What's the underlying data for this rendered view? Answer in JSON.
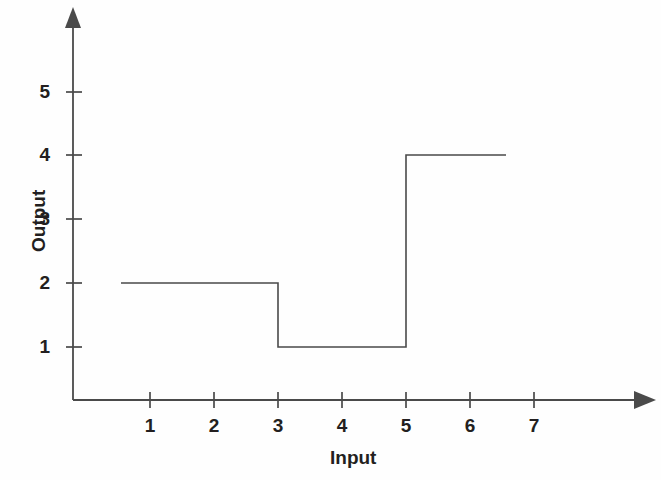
{
  "chart_data": {
    "type": "line",
    "subtype": "step",
    "title": "",
    "subtitle": "",
    "xlabel": "Input",
    "ylabel": "Output",
    "xticks": [
      1,
      2,
      3,
      4,
      5,
      6,
      7
    ],
    "xtick_labels": [
      "1",
      "2",
      "3",
      "4",
      "5",
      "6",
      "7"
    ],
    "yticks": [
      1,
      2,
      3,
      4,
      5
    ],
    "ytick_labels": [
      "1",
      "2",
      "3",
      "4",
      "5"
    ],
    "xlim": [
      0,
      8.1
    ],
    "ylim": [
      0,
      5.85
    ],
    "grid": false,
    "legend": null,
    "axis_style": "arrow-ended L-axes",
    "line_color": "#4a4a4a",
    "line_width": 1.6,
    "series": [
      {
        "name": "step",
        "step_segments": [
          {
            "x_start": 0.56,
            "x_end": 3.0,
            "y": 2
          },
          {
            "x_start": 3.0,
            "x_end": 5.0,
            "y": 1
          },
          {
            "x_start": 5.0,
            "x_end": 6.55,
            "y": 4
          }
        ],
        "points": [
          {
            "x": 0.56,
            "y": 2
          },
          {
            "x": 3.0,
            "y": 2
          },
          {
            "x": 3.0,
            "y": 1
          },
          {
            "x": 5.0,
            "y": 1
          },
          {
            "x": 5.0,
            "y": 4
          },
          {
            "x": 6.55,
            "y": 4
          }
        ]
      }
    ]
  },
  "axes": {
    "y_title": "Output",
    "x_title": "Input"
  },
  "ticks": {
    "y": [
      {
        "label": "5",
        "value": 5
      },
      {
        "label": "4",
        "value": 4
      },
      {
        "label": "3",
        "value": 3
      },
      {
        "label": "2",
        "value": 2
      },
      {
        "label": "1",
        "value": 1
      }
    ],
    "x": [
      {
        "label": "1",
        "value": 1
      },
      {
        "label": "2",
        "value": 2
      },
      {
        "label": "3",
        "value": 3
      },
      {
        "label": "4",
        "value": 4
      },
      {
        "label": "5",
        "value": 5
      },
      {
        "label": "6",
        "value": 6
      },
      {
        "label": "7",
        "value": 7
      }
    ]
  },
  "colors": {
    "ink": "#231f20",
    "axis": "#4a4a4a",
    "curve": "#4a4a4a",
    "background": "#fefefe"
  }
}
